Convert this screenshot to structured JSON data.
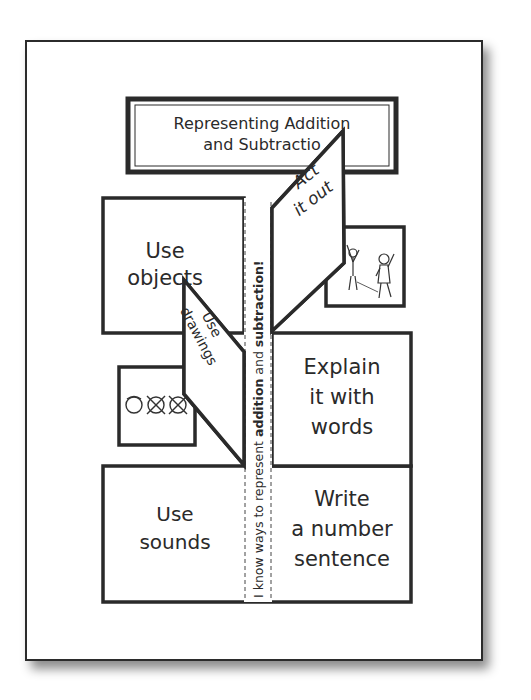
{
  "document": {
    "title_line1": "Representing Addition",
    "title_line2": "and Subtraction",
    "title_visible_line2": "and Subtractio",
    "spine_text_prefix": "I know ways to represent ",
    "spine_bold_1": "addition",
    "spine_mid": " and ",
    "spine_bold_2": "subtraction!",
    "flaps": {
      "top_left": {
        "line1": "Use",
        "line2": "objects"
      },
      "act_out": {
        "line1": "Act",
        "line2": "it out"
      },
      "drawings": {
        "line1": "Use",
        "line2": "drawings"
      },
      "explain": {
        "line1": "Explain",
        "line2": "it with",
        "line3": "words"
      },
      "sounds": {
        "line1": "Use",
        "line2": "sounds"
      },
      "number_sentence": {
        "line1": "Write",
        "line2": "a number",
        "line3": "sentence"
      }
    },
    "illustrations": {
      "act_out_picture": "two-children-acting-icon",
      "drawings_picture": "crossed-circles-drawing-icon"
    }
  },
  "colors": {
    "ink": "#2a2a2a",
    "paper": "#ffffff",
    "shadow": "#8a8a8a"
  }
}
